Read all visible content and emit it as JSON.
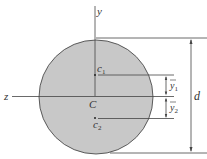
{
  "diagram": {
    "type": "circular cross-section with centroidal axes",
    "shape_fill": "#c8c8c8",
    "shape_stroke": "#3a3a3a",
    "labels": {
      "y_axis": "y",
      "z_axis": "z",
      "centroid": "C",
      "c1": "c",
      "c1_sub": "1",
      "c2": "c",
      "c2_sub": "2",
      "ybar1": "y",
      "ybar1_sub": "1",
      "ybar2": "y",
      "ybar2_sub": "2",
      "diameter": "d"
    }
  }
}
